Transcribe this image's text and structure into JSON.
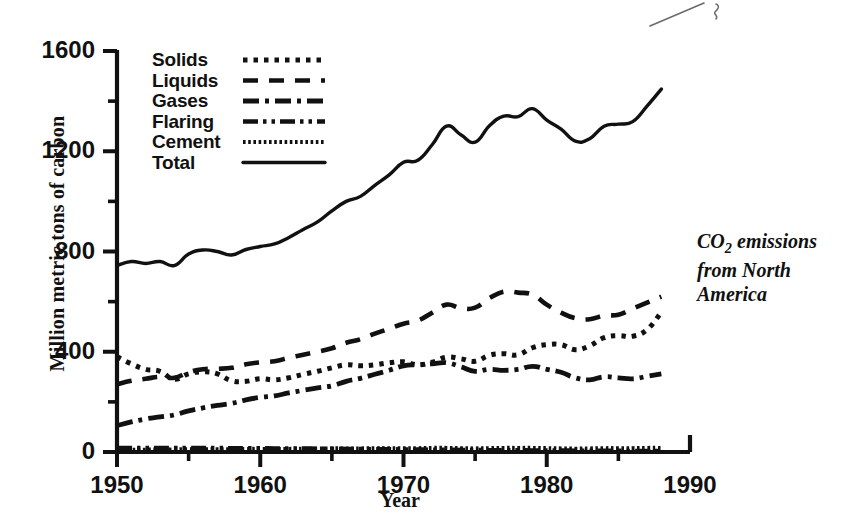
{
  "chart_data": {
    "type": "line",
    "title": "",
    "annotation": "CO2 emissions from North America",
    "annotation_lines": [
      "CO2 emissions",
      "from North",
      "America"
    ],
    "xlabel": "Year",
    "ylabel": "Million metric tons of carbon",
    "xlim": [
      1950,
      1990
    ],
    "ylim": [
      0,
      1600
    ],
    "xticks": [
      1950,
      1960,
      1970,
      1980,
      1990
    ],
    "xticklabels": [
      "1950",
      "1960",
      "1970",
      "1980",
      "1990"
    ],
    "xminorticks": [
      1955,
      1965,
      1975,
      1985
    ],
    "yticks": [
      0,
      400,
      800,
      1200,
      1600
    ],
    "yticklabels": [
      "0",
      "400",
      "800",
      "1200",
      "1600"
    ],
    "yminorticks": [
      200,
      600,
      1000,
      1400
    ],
    "grid": false,
    "legend_position": "upper-left-inside",
    "x": [
      1950,
      1951,
      1952,
      1953,
      1954,
      1955,
      1956,
      1957,
      1958,
      1959,
      1960,
      1961,
      1962,
      1963,
      1964,
      1965,
      1966,
      1967,
      1968,
      1969,
      1970,
      1971,
      1972,
      1973,
      1974,
      1975,
      1976,
      1977,
      1978,
      1979,
      1980,
      1981,
      1982,
      1983,
      1984,
      1985,
      1986,
      1987,
      1988
    ],
    "series": [
      {
        "name": "Solids",
        "dash": "dotted",
        "values": [
          380,
          352,
          330,
          322,
          290,
          312,
          320,
          312,
          284,
          282,
          292,
          288,
          296,
          310,
          322,
          336,
          348,
          344,
          348,
          356,
          360,
          348,
          358,
          378,
          372,
          362,
          386,
          392,
          388,
          416,
          428,
          428,
          408,
          424,
          456,
          464,
          462,
          488,
          558
        ]
      },
      {
        "name": "Liquids",
        "dash": "dashed",
        "values": [
          270,
          284,
          292,
          300,
          296,
          318,
          330,
          332,
          336,
          350,
          358,
          362,
          376,
          388,
          400,
          414,
          436,
          450,
          472,
          492,
          512,
          524,
          556,
          588,
          574,
          576,
          614,
          640,
          636,
          628,
          588,
          556,
          534,
          530,
          544,
          548,
          572,
          596,
          620
        ]
      },
      {
        "name": "Gases",
        "dash": "dashdot",
        "values": [
          105,
          120,
          132,
          140,
          148,
          164,
          176,
          186,
          194,
          208,
          218,
          224,
          236,
          246,
          256,
          264,
          282,
          294,
          310,
          326,
          344,
          348,
          352,
          356,
          340,
          322,
          330,
          326,
          330,
          342,
          330,
          318,
          296,
          288,
          300,
          296,
          292,
          302,
          312
        ]
      },
      {
        "name": "Flaring",
        "dash": "dashdotdot",
        "values": [
          16,
          16,
          16,
          16,
          16,
          16,
          16,
          16,
          15,
          15,
          15,
          14,
          14,
          14,
          13,
          13,
          12,
          12,
          11,
          11,
          10,
          10,
          9,
          9,
          8,
          8,
          7,
          7,
          7,
          6,
          6,
          6,
          5,
          5,
          5,
          5,
          4,
          4,
          4
        ]
      },
      {
        "name": "Cement",
        "dash": "finedotted",
        "values": [
          8,
          9,
          9,
          10,
          10,
          11,
          11,
          11,
          11,
          12,
          12,
          12,
          12,
          13,
          13,
          14,
          14,
          14,
          15,
          15,
          15,
          15,
          16,
          16,
          15,
          14,
          15,
          16,
          16,
          16,
          15,
          14,
          13,
          14,
          15,
          15,
          15,
          16,
          16
        ]
      },
      {
        "name": "Total",
        "dash": "solid",
        "values": [
          744,
          760,
          752,
          760,
          744,
          790,
          806,
          800,
          786,
          808,
          820,
          830,
          856,
          888,
          918,
          962,
          1000,
          1020,
          1064,
          1106,
          1156,
          1164,
          1226,
          1300,
          1266,
          1236,
          1302,
          1340,
          1338,
          1370,
          1324,
          1288,
          1240,
          1250,
          1300,
          1308,
          1318,
          1380,
          1448
        ]
      }
    ]
  },
  "legend": {
    "items": [
      {
        "label": "Solids"
      },
      {
        "label": "Liquids"
      },
      {
        "label": "Gases"
      },
      {
        "label": "Flaring"
      },
      {
        "label": "Cement"
      },
      {
        "label": "Total"
      }
    ]
  },
  "colors": {
    "ink": "#111111",
    "background": "#ffffff"
  }
}
